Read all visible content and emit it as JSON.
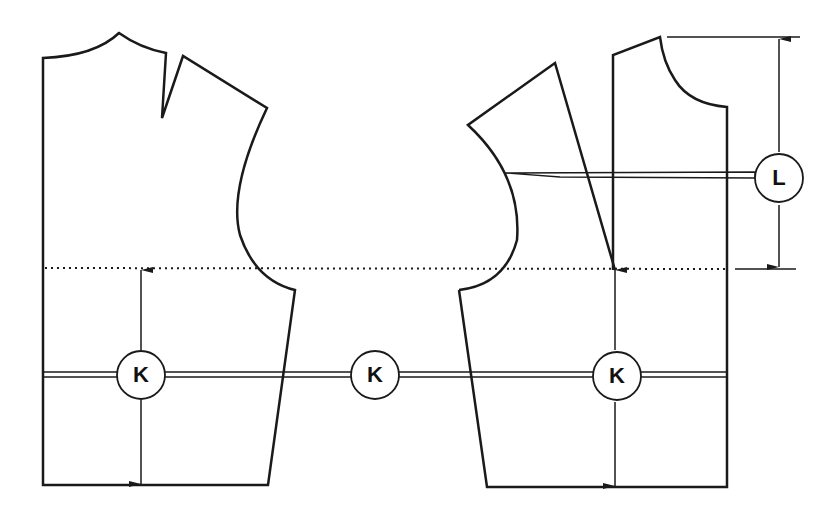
{
  "diagram": {
    "type": "sewing-pattern-bodice",
    "pieces": [
      "back-bodice",
      "front-bodice"
    ],
    "guide_lines": {
      "dotted": "armhole-depth-line",
      "K": "waist-to-armhole measurement line",
      "L": "armhole-depth measurement line"
    },
    "labels": {
      "k_left": "K",
      "k_middle": "K",
      "k_right": "K",
      "l": "L"
    },
    "colors": {
      "stroke": "#1a1a1a",
      "background": "#ffffff"
    }
  }
}
